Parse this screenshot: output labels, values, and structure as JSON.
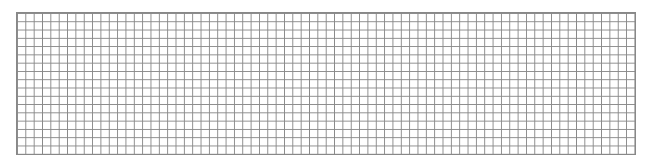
{
  "grid": {
    "columns": 74,
    "rows": 17,
    "line_color": "#888888",
    "background": "#ffffff"
  }
}
